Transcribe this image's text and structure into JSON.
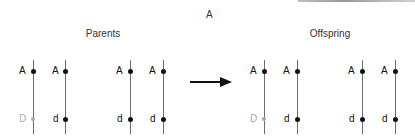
{
  "title": "A",
  "groups": {
    "parents": {
      "label": "Parents"
    },
    "offspring": {
      "label": "Offspring"
    }
  },
  "colors": {
    "line": "#6d6d6d",
    "dot": "#111111",
    "faded": "#a8a8a8"
  },
  "chromosomes": {
    "p1": {
      "upper": "A",
      "lower": "D"
    },
    "p2": {
      "upper": "A",
      "lower": "d"
    },
    "p3": {
      "upper": "A",
      "lower": "d"
    },
    "p4": {
      "upper": "A",
      "lower": "d"
    },
    "o1": {
      "upper": "A",
      "lower": "D"
    },
    "o2": {
      "upper": "A",
      "lower": "d"
    },
    "o3": {
      "upper": "A",
      "lower": "d"
    },
    "o4": {
      "upper": "A",
      "lower": "d"
    }
  },
  "arrow": {
    "direction": "right"
  }
}
